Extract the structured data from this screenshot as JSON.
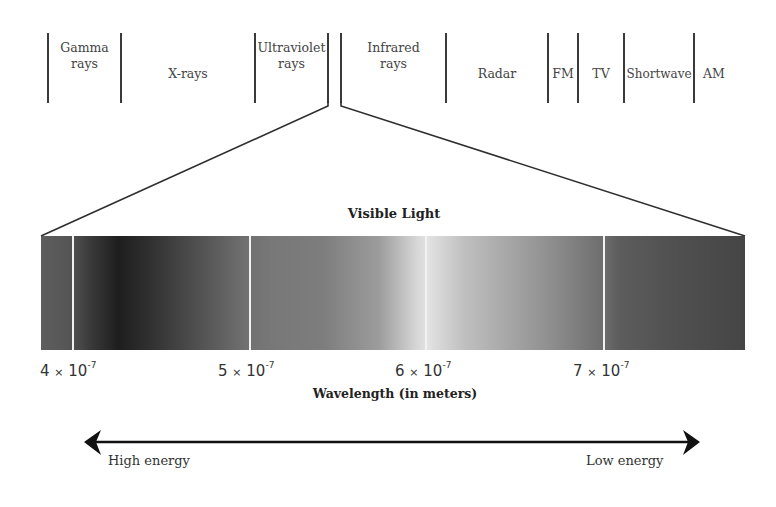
{
  "spectrum_bands": [
    {
      "label_line1": "Gamma",
      "label_line2": "rays"
    },
    {
      "label_line1": "X-rays",
      "label_line2": ""
    },
    {
      "label_line1": "Ultraviolet",
      "label_line2": "rays"
    },
    {
      "label_line1": "Infrared",
      "label_line2": "rays"
    },
    {
      "label_line1": "Radar",
      "label_line2": ""
    },
    {
      "label_line1": "FM",
      "label_line2": ""
    },
    {
      "label_line1": "TV",
      "label_line2": ""
    },
    {
      "label_line1": "Shortwave",
      "label_line2": ""
    },
    {
      "label_line1": "AM",
      "label_line2": ""
    }
  ],
  "visible": {
    "title": "Visible Light"
  },
  "axis": {
    "ticks": [
      {
        "mantissa": "4",
        "times": "×",
        "base": "10",
        "exp": "-7"
      },
      {
        "mantissa": "5",
        "times": "×",
        "base": "10",
        "exp": "-7"
      },
      {
        "mantissa": "6",
        "times": "×",
        "base": "10",
        "exp": "-7"
      },
      {
        "mantissa": "7",
        "times": "×",
        "base": "10",
        "exp": "-7"
      }
    ],
    "title": "Wavelength (in meters)"
  },
  "energy_arrow": {
    "left_label": "High energy",
    "right_label": "Low energy"
  },
  "colors": {
    "line": "#3a3a3a",
    "text": "#333333",
    "separator": "#f2f2f2"
  }
}
